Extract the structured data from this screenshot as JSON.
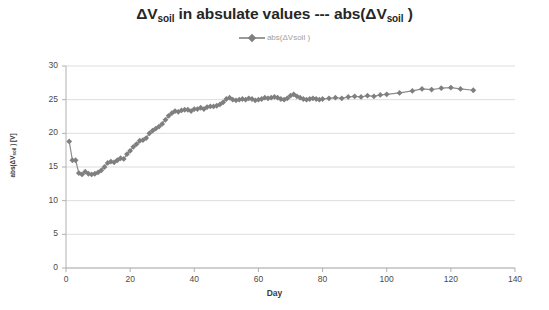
{
  "figure": {
    "background": "#ffffff",
    "title_main": "ΔV",
    "title_sub1": "soil",
    "title_mid": " in absulate values --- abs(ΔV",
    "title_sub2": "soil",
    "title_end": " )",
    "title_full": "ΔVsoil in absulate values --- abs(ΔVsoil )"
  },
  "legend": {
    "position": "top-center",
    "marker": "diamond-marker",
    "entries": [
      {
        "label": "abs(ΔVsoil )",
        "color": "#808080"
      }
    ]
  },
  "axis": {
    "y_title_main": "abs(ΔV",
    "y_title_sub": "soil",
    "y_title_end": " ) [V]",
    "x_title": "Day"
  },
  "chart_data": {
    "type": "line",
    "title": "ΔVsoil in absulate values --- abs(ΔVsoil )",
    "xlabel": "Day",
    "ylabel": "abs(ΔVsoil ) [V]",
    "xlim": [
      0,
      140
    ],
    "ylim": [
      0,
      30
    ],
    "xticks": [
      0,
      20,
      40,
      60,
      80,
      100,
      120,
      140
    ],
    "yticks": [
      0,
      5,
      10,
      15,
      20,
      25,
      30
    ],
    "grid": "horizontal",
    "legend_position": "top-center",
    "line_color": "#8c8c8c",
    "marker_color": "#7f7f7f",
    "marker": "diamond",
    "series": [
      {
        "name": "abs(ΔVsoil )",
        "x": [
          1,
          2,
          3,
          4,
          5,
          6,
          7,
          8,
          9,
          10,
          11,
          12,
          13,
          14,
          15,
          16,
          17,
          18,
          19,
          20,
          21,
          22,
          23,
          24,
          25,
          26,
          27,
          28,
          29,
          30,
          31,
          32,
          33,
          34,
          35,
          36,
          37,
          38,
          39,
          40,
          41,
          42,
          43,
          44,
          45,
          46,
          47,
          48,
          49,
          50,
          51,
          52,
          53,
          54,
          55,
          56,
          57,
          58,
          59,
          60,
          61,
          62,
          63,
          64,
          65,
          66,
          67,
          68,
          69,
          70,
          71,
          72,
          73,
          74,
          75,
          76,
          77,
          78,
          79,
          80,
          82,
          84,
          86,
          88,
          90,
          92,
          94,
          96,
          98,
          100,
          104,
          108,
          111,
          114,
          117,
          120,
          123,
          127
        ],
        "y": [
          18.8,
          16.0,
          16.0,
          14.1,
          13.9,
          14.3,
          14.0,
          13.9,
          14.0,
          14.2,
          14.5,
          15.0,
          15.6,
          15.8,
          15.7,
          16.0,
          16.3,
          16.2,
          16.9,
          17.4,
          18.0,
          18.4,
          18.9,
          19.0,
          19.3,
          20.0,
          20.4,
          20.7,
          21.0,
          21.4,
          22.0,
          22.6,
          23.0,
          23.3,
          23.2,
          23.4,
          23.5,
          23.5,
          23.3,
          23.6,
          23.6,
          23.8,
          23.6,
          23.9,
          24.0,
          24.0,
          24.1,
          24.3,
          24.6,
          25.1,
          25.3,
          25.0,
          24.9,
          25.0,
          25.1,
          25.0,
          25.2,
          25.1,
          24.9,
          25.0,
          25.1,
          25.3,
          25.2,
          25.3,
          25.4,
          25.3,
          25.1,
          25.0,
          25.2,
          25.6,
          25.8,
          25.5,
          25.3,
          25.1,
          25.0,
          25.1,
          25.2,
          25.1,
          25.0,
          25.1,
          25.2,
          25.3,
          25.2,
          25.4,
          25.5,
          25.4,
          25.6,
          25.5,
          25.7,
          25.8,
          26.0,
          26.3,
          26.6,
          26.5,
          26.7,
          26.8,
          26.6,
          26.4
        ]
      }
    ]
  }
}
